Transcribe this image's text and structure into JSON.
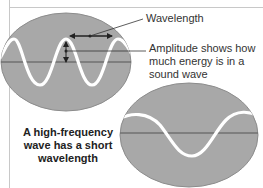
{
  "labels": {
    "wavelength": "Wavelength",
    "amplitude": "Amplitude shows how much energy is in a sound wave",
    "caption": "A high-frequency wave has a short wavelength"
  },
  "colors": {
    "background": "#ffffff",
    "frame": "#c8c8c8",
    "oscilloscope_fill": "#a8a8a8",
    "oscilloscope_edge": "#8c8c8c",
    "wave": "#ffffff",
    "baseline": "#555555",
    "annotation": "#333333"
  },
  "diagrams": [
    {
      "name": "high-frequency-wave",
      "description": "Oscilloscope screen showing a high-frequency wave (short wavelength)",
      "cycles_visible": 2
    },
    {
      "name": "low-frequency-wave",
      "description": "Oscilloscope screen showing a low-frequency wave (long wavelength)",
      "cycles_visible": 1
    }
  ]
}
